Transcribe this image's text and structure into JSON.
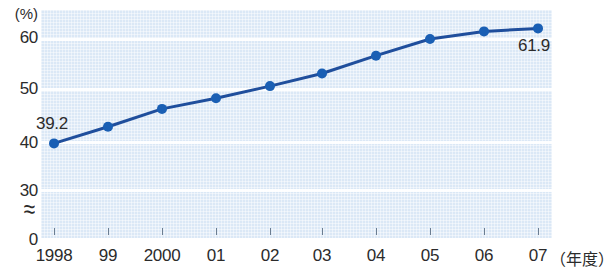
{
  "chart_data": {
    "type": "line",
    "title": "",
    "subtitle": "",
    "xlabel": "年度",
    "ylabel": "(%)",
    "ylim": [
      30,
      65
    ],
    "ytick_labels": [
      "60",
      "50",
      "40",
      "30",
      "0"
    ],
    "ytick_values": [
      60,
      50,
      40,
      30,
      0
    ],
    "axis_break": "≈",
    "grid": true,
    "legend": "none",
    "categories": [
      "1998",
      "99",
      "2000",
      "01",
      "02",
      "03",
      "04",
      "05",
      "06",
      "07"
    ],
    "x": [
      1998,
      1999,
      2000,
      2001,
      2002,
      2003,
      2004,
      2005,
      2006,
      2007
    ],
    "values": [
      39.2,
      42.5,
      46.0,
      48.1,
      50.5,
      53.0,
      56.5,
      59.8,
      61.3,
      61.9
    ],
    "annotations": [
      {
        "name": "first-point-label",
        "text": "39.2",
        "index": 0,
        "value": 39.2
      },
      {
        "name": "last-point-label",
        "text": "61.9",
        "index": 9,
        "value": 61.9
      }
    ],
    "series": [
      {
        "name": "series-1",
        "color": "#1f4e9c",
        "marker": "circle",
        "values": [
          39.2,
          42.5,
          46.0,
          48.1,
          50.5,
          53.0,
          56.5,
          59.8,
          61.3,
          61.9
        ]
      }
    ],
    "colors": {
      "line": "#1f4e9c",
      "marker": "#1a5fb4",
      "plot_background": "#dbe8f6",
      "gridline": "#ffffff",
      "text": "#2b2b2b",
      "tick": "#6b7d91"
    }
  },
  "axes": {
    "y_unit": "(%)",
    "y_ticks": [
      {
        "label": "60",
        "top": 28
      },
      {
        "label": "50",
        "top": 79
      },
      {
        "label": "40",
        "top": 133
      },
      {
        "label": "30",
        "top": 181
      },
      {
        "label": "0",
        "top": 230
      }
    ],
    "x_ticks": [
      {
        "label": "1998",
        "cx": 54
      },
      {
        "label": "99",
        "cx": 108
      },
      {
        "label": "2000",
        "cx": 162
      },
      {
        "label": "01",
        "cx": 216
      },
      {
        "label": "02",
        "cx": 270
      },
      {
        "label": "03",
        "cx": 322
      },
      {
        "label": "04",
        "cx": 376
      },
      {
        "label": "05",
        "cx": 430
      },
      {
        "label": "06",
        "cx": 484
      },
      {
        "label": "07",
        "cx": 538
      }
    ],
    "x_unit": "（年度）"
  }
}
